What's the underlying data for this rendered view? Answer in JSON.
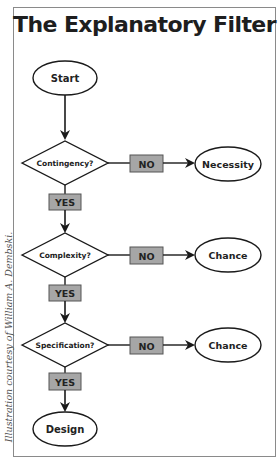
{
  "title": "The Explanatory Filter",
  "credit": "Illustration courtesy of William A. Dembski.",
  "colors": {
    "label_box_fill": "#a6a6a6",
    "stroke": "#1a1a1a",
    "frame": "#8a8a8a"
  },
  "nodes": {
    "start": "Start",
    "decisions": [
      {
        "question": "Contingency?",
        "no_label": "NO",
        "no_outcome": "Necessity",
        "yes_label": "YES"
      },
      {
        "question": "Complexity?",
        "no_label": "NO",
        "no_outcome": "Chance",
        "yes_label": "YES"
      },
      {
        "question": "Specification?",
        "no_label": "NO",
        "no_outcome": "Chance",
        "yes_label": "YES"
      }
    ],
    "end": "Design"
  }
}
